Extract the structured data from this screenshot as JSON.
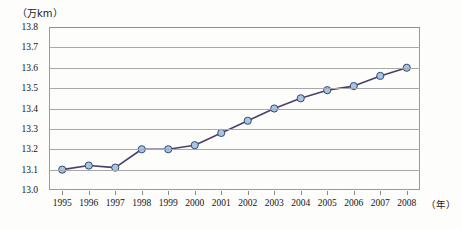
{
  "chart_data": {
    "type": "line",
    "title": "",
    "subtitle": "",
    "xlabel": "年",
    "ylabel": "万km",
    "y_unit_label": "（万km）",
    "x_unit_label": "（年）",
    "categories": [
      1995,
      1996,
      1997,
      1998,
      1999,
      2000,
      2001,
      2002,
      2003,
      2004,
      2005,
      2006,
      2007,
      2008
    ],
    "x_tick_labels": [
      "1995",
      "1996",
      "1997",
      "1998",
      "1999",
      "2000",
      "2001",
      "2002",
      "2003",
      "2004",
      "2005",
      "2006",
      "2007",
      "2008"
    ],
    "values": [
      13.1,
      13.12,
      13.11,
      13.2,
      13.2,
      13.22,
      13.28,
      13.34,
      13.4,
      13.45,
      13.49,
      13.51,
      13.56,
      13.6
    ],
    "y_tick_labels": [
      "13.8",
      "13.7",
      "13.6",
      "13.5",
      "13.4",
      "13.3",
      "13.2",
      "13.1",
      "13.0"
    ],
    "y_ticks": [
      13.8,
      13.7,
      13.6,
      13.5,
      13.4,
      13.3,
      13.2,
      13.1,
      13.0
    ],
    "ylim": [
      13.0,
      13.8
    ],
    "y_step": 0.1,
    "grid": true,
    "grid_axis": "y",
    "legend": false,
    "legend_position": "none",
    "series": [
      {
        "name": "",
        "values": [
          13.1,
          13.12,
          13.11,
          13.2,
          13.2,
          13.22,
          13.28,
          13.34,
          13.4,
          13.45,
          13.49,
          13.51,
          13.56,
          13.6
        ],
        "line_color": "#4a3f6b",
        "marker_fill": "#a8c4de",
        "marker_edge": "#2e4a7a",
        "marker": "circle"
      }
    ],
    "colors": {
      "line": "#4a3f6b",
      "marker_fill": "#a8c4de",
      "marker_edge": "#2e4a7a",
      "grid": "#a8a8a8",
      "frame": "#9a9a9a",
      "text": "#141414",
      "background": "#fdfdfc"
    }
  }
}
